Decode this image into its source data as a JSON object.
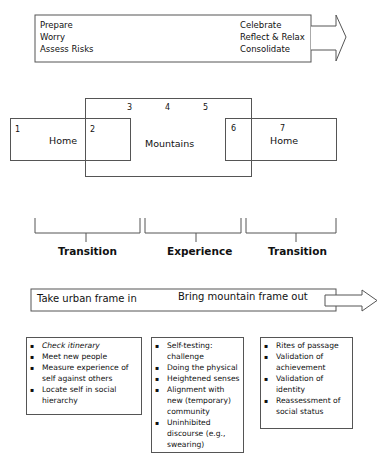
{
  "header": {
    "faded_title": ""
  },
  "top_arrow": {
    "left_items": [
      "Prepare",
      "Worry",
      "Assess Risks"
    ],
    "right_items": [
      "Celebrate",
      "Reflect & Relax",
      "Consolidate"
    ],
    "arrow_icon": "right-arrow"
  },
  "venn": {
    "left_box": {
      "number": "1",
      "label": "Home"
    },
    "overlap_left": {
      "number": "2"
    },
    "center_box": {
      "numbers": [
        "3",
        "4",
        "5"
      ],
      "label": "Mountains"
    },
    "overlap_right": {
      "number": "6"
    },
    "right_box": {
      "number": "7",
      "label": "Home"
    }
  },
  "phases": [
    {
      "label": "Transition"
    },
    {
      "label": "Experience"
    },
    {
      "label": "Transition"
    }
  ],
  "frame_arrow": {
    "left_text": "Take urban frame in",
    "right_text": "Bring mountain frame out",
    "arrow_icon": "right-arrow"
  },
  "phase_lists": [
    {
      "items": [
        "Check itinerary",
        "Meet new people",
        "Measure experience of self against others",
        "Locate self in social hierarchy"
      ]
    },
    {
      "items": [
        "Self-testing: challenge",
        "Doing the physical",
        "Heightened senses",
        "Alignment with new (temporary) community",
        "Uninhibited discourse (e.g., swearing)"
      ]
    },
    {
      "items": [
        "Rites of passage",
        "Validation of achievement",
        "Validation of identity",
        "Reassessment of social status"
      ]
    }
  ]
}
